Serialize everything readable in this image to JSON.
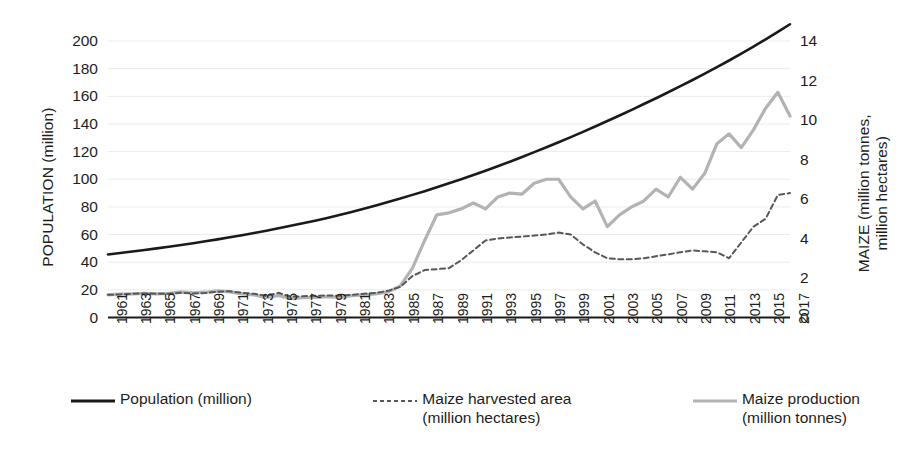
{
  "chart_data": {
    "type": "line",
    "title": "",
    "xlabel": "",
    "ylabel": "POPULATION (million)",
    "y2label": "MAIZE  (million tonnes,\nmillion hectares)",
    "grid": true,
    "legend_position": "bottom",
    "xlim": [
      1961,
      2017
    ],
    "ylim": [
      0,
      200
    ],
    "y2lim": [
      0,
      14
    ],
    "yticks": [
      0,
      20,
      40,
      60,
      80,
      100,
      120,
      140,
      160,
      180,
      200
    ],
    "y2ticks": [
      0,
      2,
      4,
      6,
      8,
      10,
      12,
      14
    ],
    "xticks": [
      1961,
      1963,
      1965,
      1967,
      1969,
      1971,
      1973,
      1975,
      1977,
      1979,
      1981,
      1983,
      1985,
      1987,
      1989,
      1991,
      1993,
      1995,
      1997,
      1999,
      2001,
      2003,
      2005,
      2007,
      2009,
      2011,
      2013,
      2015,
      2017
    ],
    "x": [
      1961,
      1962,
      1963,
      1964,
      1965,
      1966,
      1967,
      1968,
      1969,
      1970,
      1971,
      1972,
      1973,
      1974,
      1975,
      1976,
      1977,
      1978,
      1979,
      1980,
      1981,
      1982,
      1983,
      1984,
      1985,
      1986,
      1987,
      1988,
      1989,
      1990,
      1991,
      1992,
      1993,
      1994,
      1995,
      1996,
      1997,
      1998,
      1999,
      2000,
      2001,
      2002,
      2003,
      2004,
      2005,
      2006,
      2007,
      2008,
      2009,
      2010,
      2011,
      2012,
      2013,
      2014,
      2015,
      2016,
      2017
    ],
    "series": [
      {
        "name": "Population (million)",
        "axis": "left",
        "unit": "million",
        "style": "solid",
        "color": "#1a1a1a",
        "values": [
          45.6,
          46.6,
          47.7,
          48.8,
          50.0,
          51.2,
          52.4,
          53.7,
          55.1,
          56.5,
          58.0,
          59.5,
          61.1,
          62.8,
          64.5,
          66.3,
          68.1,
          70.0,
          72.0,
          74.1,
          76.3,
          78.6,
          81.0,
          83.5,
          86.0,
          88.7,
          91.4,
          94.2,
          97.1,
          100.0,
          103.1,
          106.2,
          109.4,
          112.7,
          116.1,
          119.6,
          123.2,
          126.8,
          130.5,
          134.3,
          138.2,
          142.1,
          146.1,
          150.2,
          154.4,
          158.6,
          162.9,
          167.3,
          171.8,
          176.4,
          181.1,
          185.9,
          190.9,
          196.0,
          201.2,
          206.6,
          212.1
        ]
      },
      {
        "name": "Maize harvested area (million hectares)",
        "axis": "right",
        "unit": "million hectares",
        "style": "dotted",
        "color": "#585858",
        "values": [
          1.15,
          1.17,
          1.2,
          1.22,
          1.2,
          1.2,
          1.25,
          1.22,
          1.24,
          1.3,
          1.33,
          1.25,
          1.2,
          1.1,
          1.25,
          1.05,
          1.08,
          1.1,
          1.12,
          1.1,
          1.15,
          1.2,
          1.25,
          1.35,
          1.55,
          2.1,
          2.4,
          2.45,
          2.5,
          2.9,
          3.4,
          3.9,
          4.0,
          4.05,
          4.1,
          4.15,
          4.2,
          4.3,
          4.2,
          3.7,
          3.3,
          3.0,
          2.95,
          2.95,
          3.0,
          3.1,
          3.2,
          3.3,
          3.4,
          3.35,
          3.3,
          3.0,
          3.8,
          4.6,
          5.0,
          6.2,
          6.3
        ]
      },
      {
        "name": "Maize production (million tonnes)",
        "axis": "right",
        "unit": "million tonnes",
        "style": "solid-light",
        "color": "#b3b3b3",
        "values": [
          1.15,
          1.18,
          1.2,
          1.22,
          1.2,
          1.22,
          1.3,
          1.25,
          1.28,
          1.35,
          1.3,
          1.2,
          1.15,
          1.0,
          1.12,
          0.95,
          1.0,
          1.02,
          1.05,
          1.02,
          1.1,
          1.15,
          1.2,
          1.3,
          1.6,
          2.5,
          3.9,
          5.2,
          5.3,
          5.5,
          5.8,
          5.5,
          6.1,
          6.3,
          6.25,
          6.8,
          7.0,
          7.0,
          6.1,
          5.5,
          5.9,
          4.6,
          5.2,
          5.6,
          5.9,
          6.5,
          6.1,
          7.1,
          6.5,
          7.3,
          8.8,
          9.3,
          8.6,
          9.5,
          10.6,
          11.4,
          10.2
        ]
      }
    ]
  },
  "axes": {
    "left": {
      "title": "POPULATION (million)",
      "ticks": [
        "200",
        "180",
        "160",
        "140",
        "120",
        "100",
        "80",
        "60",
        "40",
        "20",
        "0"
      ]
    },
    "right": {
      "title": "MAIZE  (million tonnes,\nmillion hectares)",
      "ticks": [
        "14",
        "12",
        "10",
        "8",
        "6",
        "4",
        "2",
        "0"
      ]
    },
    "x": {
      "ticks": [
        "1961",
        "1963",
        "1965",
        "1967",
        "1969",
        "1971",
        "1973",
        "1975",
        "1977",
        "1979",
        "1981",
        "1983",
        "1985",
        "1987",
        "1989",
        "1991",
        "1993",
        "1995",
        "1997",
        "1999",
        "2001",
        "2003",
        "2005",
        "2007",
        "2009",
        "2011",
        "2013",
        "2015",
        "2017"
      ]
    }
  },
  "legend": {
    "entries": [
      {
        "label": "Population (million)",
        "style": "solid",
        "color": "#1a1a1a"
      },
      {
        "label": "Maize harvested area\n(million hectares)",
        "style": "dotted",
        "color": "#585858"
      },
      {
        "label": "Maize production\n(million tonnes)",
        "style": "solid-light",
        "color": "#b3b3b3"
      }
    ]
  },
  "colors": {
    "population": "#1a1a1a",
    "harvested_area": "#585858",
    "production": "#b3b3b3",
    "grid": "#ebebeb",
    "axis": "#1a1a1a",
    "background": "#ffffff"
  }
}
